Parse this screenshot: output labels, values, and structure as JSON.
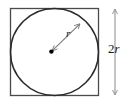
{
  "figure": {
    "labels": {
      "radius": "r",
      "diameter_coefficient": "2",
      "diameter_variable": "r",
      "diameter_full": "2r"
    },
    "colors": {
      "stroke": "#3a3a3a",
      "square_stroke": "#4a4a4a",
      "circle_stroke": "#2b2b2b",
      "arrow_stroke": "#7a7a7a",
      "dimension_stroke": "#8a8a8a",
      "center_dot": "#000000",
      "background": "#ffffff",
      "text": "#1a1a1a"
    },
    "geometry": {
      "square": {
        "x": 10,
        "y": 8,
        "width": 89,
        "height": 88
      },
      "circle": {
        "cx": 54.5,
        "cy": 52,
        "r": 44
      },
      "center_dot": {
        "cx": 51.5,
        "cy": 51.5,
        "r": 2.1
      },
      "radius_arrow": {
        "x1": 51.5,
        "y1": 51.5,
        "x2": 81,
        "y2": 23
      },
      "dimension_line": {
        "x": 115,
        "y1": 8,
        "y2": 96
      }
    }
  }
}
